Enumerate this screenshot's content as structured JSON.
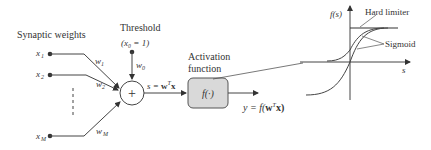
{
  "diagram": {
    "title_synaptic": "Synaptic weights",
    "threshold_label": "Threshold",
    "threshold_cond": "(x₀ = 1)",
    "inputs": [
      {
        "label": "x",
        "sub": "1",
        "weight": "w",
        "wsub": "1"
      },
      {
        "label": "x",
        "sub": "2",
        "weight": "w",
        "wsub": "2"
      },
      {
        "label": "x",
        "sub": "M",
        "weight": "w",
        "wsub": "M"
      }
    ],
    "bias_weight": {
      "label": "w",
      "sub": "0"
    },
    "summation_symbol": "+",
    "sum_expr": {
      "pre": "s = ",
      "bold": "w",
      "sup": "T",
      "post": "x"
    },
    "activation_label_1": "Activation",
    "activation_label_2": "function",
    "activation_box": "f(·)",
    "output_expr": {
      "pre": "y = f(",
      "bold": "w",
      "sup": "T",
      "post": "x)"
    },
    "plot": {
      "y_axis_label": "f(s)",
      "x_axis_label": "s",
      "legend_hard": "Hard limiter",
      "legend_sigmoid": "Sigmoid"
    }
  }
}
